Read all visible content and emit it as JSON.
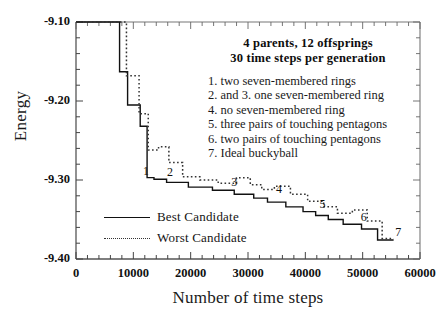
{
  "chart_data": {
    "type": "line",
    "title": "",
    "xlabel": "Number of time steps",
    "ylabel": "Energy",
    "xlim": [
      0,
      60000
    ],
    "ylim": [
      -9.4,
      -9.1
    ],
    "grid": false,
    "legend_position": "lower-left-inside",
    "xticks": [
      0,
      10000,
      20000,
      30000,
      40000,
      50000,
      60000
    ],
    "xtick_labels": [
      "0",
      "10000",
      "20000",
      "30000",
      "40000",
      "50000",
      "60000"
    ],
    "xminor_step": 2000,
    "yticks": [
      -9.1,
      -9.2,
      -9.3,
      -9.4
    ],
    "ytick_labels": [
      "-9.10",
      "-9.20",
      "-9.30",
      "-9.40"
    ],
    "yminor_step": 0.02,
    "series": [
      {
        "name": "Best Candidate",
        "style": "solid",
        "color": "#111111",
        "x": [
          0,
          7600,
          7600,
          9000,
          9000,
          11200,
          11200,
          12400,
          12400,
          13600,
          13600,
          15800,
          15800,
          19600,
          19600,
          23800,
          23800,
          27600,
          27600,
          31000,
          31000,
          33400,
          33400,
          36600,
          36600,
          39600,
          39600,
          41800,
          41800,
          44000,
          44000,
          46600,
          46600,
          49800,
          49800,
          52600,
          52600,
          55400
        ],
        "y": [
          -9.1,
          -9.1,
          -9.163,
          -9.163,
          -9.205,
          -9.205,
          -9.232,
          -9.232,
          -9.297,
          -9.297,
          -9.299,
          -9.299,
          -9.303,
          -9.303,
          -9.309,
          -9.309,
          -9.313,
          -9.313,
          -9.318,
          -9.318,
          -9.323,
          -9.323,
          -9.328,
          -9.328,
          -9.334,
          -9.334,
          -9.34,
          -9.34,
          -9.345,
          -9.345,
          -9.35,
          -9.35,
          -9.356,
          -9.356,
          -9.362,
          -9.362,
          -9.376,
          -9.376
        ]
      },
      {
        "name": "Worst Candidate",
        "style": "dotted",
        "color": "#333333",
        "x": [
          0,
          8800,
          8800,
          11000,
          11000,
          12600,
          12600,
          14400,
          14400,
          16200,
          16200,
          18600,
          18600,
          21600,
          21600,
          24800,
          24800,
          28000,
          28000,
          30400,
          30400,
          32400,
          32400,
          34600,
          34600,
          37400,
          37400,
          40400,
          40400,
          43200,
          43200,
          45600,
          45600,
          48200,
          48200,
          50800,
          50800,
          53400,
          53400,
          55400
        ],
        "y": [
          -9.1,
          -9.1,
          -9.168,
          -9.168,
          -9.216,
          -9.216,
          -9.262,
          -9.262,
          -9.258,
          -9.258,
          -9.278,
          -9.278,
          -9.296,
          -9.296,
          -9.3,
          -9.3,
          -9.304,
          -9.304,
          -9.297,
          -9.297,
          -9.306,
          -9.306,
          -9.312,
          -9.312,
          -9.308,
          -9.308,
          -9.318,
          -9.318,
          -9.327,
          -9.327,
          -9.334,
          -9.334,
          -9.342,
          -9.342,
          -9.338,
          -9.338,
          -9.352,
          -9.352,
          -9.374,
          -9.374
        ]
      }
    ],
    "point_markers": [
      {
        "label": "1",
        "x": 12200,
        "y": -9.288
      },
      {
        "label": "2",
        "x": 16400,
        "y": -9.29
      },
      {
        "label": "3",
        "x": 27600,
        "y": -9.302
      },
      {
        "label": "4",
        "x": 35400,
        "y": -9.312
      },
      {
        "label": "5",
        "x": 43000,
        "y": -9.33
      },
      {
        "label": "6",
        "x": 50200,
        "y": -9.347
      },
      {
        "label": "7",
        "x": 56200,
        "y": -9.366
      }
    ]
  },
  "annotation": {
    "headline_line1": "4 parents, 12 offsprings",
    "headline_line2": "30 time steps per generation",
    "items": [
      "1. two seven-membered rings",
      "2. and 3. one seven-membered ring",
      "4. no seven-membered ring",
      "5. three pairs of touching pentagons",
      "6. two pairs of touching pentagons",
      "7. Ideal buckyball"
    ]
  },
  "legend": {
    "entries": [
      {
        "label": "Best Candidate",
        "style": "solid"
      },
      {
        "label": "Worst Candidate",
        "style": "dotted"
      }
    ]
  }
}
